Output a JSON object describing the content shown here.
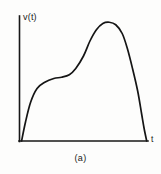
{
  "figure": {
    "caption": "(a)",
    "background_color": "#fdfdfc",
    "ink_color": "#151515"
  },
  "chart_data": {
    "type": "line",
    "title": "",
    "subtitle": "",
    "xlabel": "t",
    "ylabel": "v(t)",
    "annotations": [
      "(a)"
    ],
    "legend": [],
    "legend_position": "none",
    "grid": false,
    "axis_ticks": false,
    "tick_labels": {
      "x": [],
      "y": []
    },
    "xlim": [
      0,
      1
    ],
    "ylim": [
      0,
      1
    ],
    "series": [
      {
        "name": "v(t)",
        "color": "#151515",
        "x": [
          0.02,
          0.05,
          0.09,
          0.14,
          0.2,
          0.27,
          0.33,
          0.39,
          0.44,
          0.5,
          0.55,
          0.6,
          0.65,
          0.7,
          0.75,
          0.8,
          0.84,
          0.88,
          0.92,
          0.95,
          0.97,
          0.99
        ],
        "y": [
          0.0,
          0.15,
          0.31,
          0.42,
          0.47,
          0.5,
          0.51,
          0.53,
          0.58,
          0.68,
          0.8,
          0.89,
          0.94,
          0.95,
          0.93,
          0.86,
          0.74,
          0.58,
          0.4,
          0.22,
          0.1,
          0.0
        ]
      }
    ],
    "axes": {
      "y_axis": {
        "x": 19,
        "y_top": 16,
        "y_bottom": 141
      },
      "x_axis": {
        "y": 141,
        "x_left": 19,
        "x_right": 148
      }
    }
  }
}
